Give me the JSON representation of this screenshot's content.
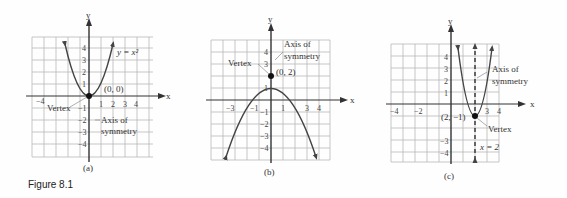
{
  "figure_label": "Figure 8.1",
  "graphs": [
    {
      "caption": "(a)",
      "equation": "y = x²",
      "vertex_label": "Vertex",
      "vertex_point": "(0, 0)",
      "axis_label_line1": "Axis of",
      "axis_label_line2": "symmetry",
      "x_axis": "x",
      "y_axis": "y",
      "x_ticks": [
        "−4",
        "1",
        "2",
        "3",
        "4"
      ],
      "y_ticks": [
        "4",
        "3",
        "2",
        "1",
        "−1",
        "−2",
        "−3",
        "−4"
      ]
    },
    {
      "caption": "(b)",
      "vertex_label": "Vertex",
      "vertex_point": "(0, 2)",
      "axis_label_line1": "Axis of",
      "axis_label_line2": "symmetry",
      "x_axis": "x",
      "y_axis": "y",
      "x_ticks": [
        "−3",
        "−1",
        "1",
        "3",
        "4"
      ],
      "y_ticks": [
        "4",
        "3",
        "1",
        "−1",
        "−2",
        "−3",
        "−4"
      ]
    },
    {
      "caption": "(c)",
      "vertex_label": "Vertex",
      "vertex_point": "(2, −1)",
      "axis_label_line1": "Axis of",
      "axis_label_line2": "symmetry",
      "axis_equation": "x = 2",
      "x_axis": "x",
      "y_axis": "y",
      "x_ticks": [
        "−4",
        "−2",
        "3",
        "4"
      ],
      "y_ticks": [
        "4",
        "3",
        "2",
        "1",
        "−3",
        "−4"
      ]
    }
  ]
}
